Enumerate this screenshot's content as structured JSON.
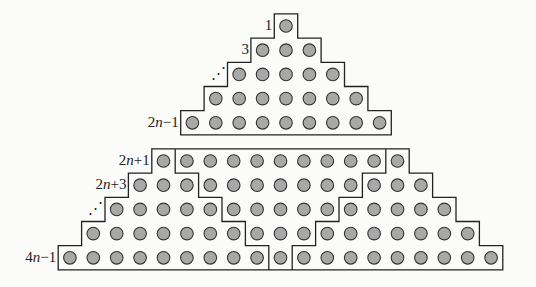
{
  "figure": {
    "colors": {
      "outline": "#222222",
      "dot_fill": "#a8a8a8",
      "dot_stroke": "#333333",
      "background": "#fbfbf9"
    },
    "top_triangle": {
      "rows": [
        1,
        3,
        5,
        7,
        9
      ],
      "labels": [
        {
          "row": 0,
          "text": "1"
        },
        {
          "row": 1,
          "text": "3"
        },
        {
          "row": 2,
          "text": "⋰"
        },
        {
          "row": 4,
          "text": "2n−1"
        }
      ]
    },
    "bottom_trapezoid": {
      "rows": [
        11,
        13,
        15,
        17,
        19
      ],
      "partition": "left triangle (1,3,5,7,9) | inverted middle triangle (9,7,5,3,1) | right triangle (1,3,5,7,9)",
      "labels": [
        {
          "row": 0,
          "text": "2n+1"
        },
        {
          "row": 1,
          "text": "2n+3"
        },
        {
          "row": 2,
          "text": "⋰"
        },
        {
          "row": 4,
          "text": "4n−1"
        }
      ]
    }
  }
}
